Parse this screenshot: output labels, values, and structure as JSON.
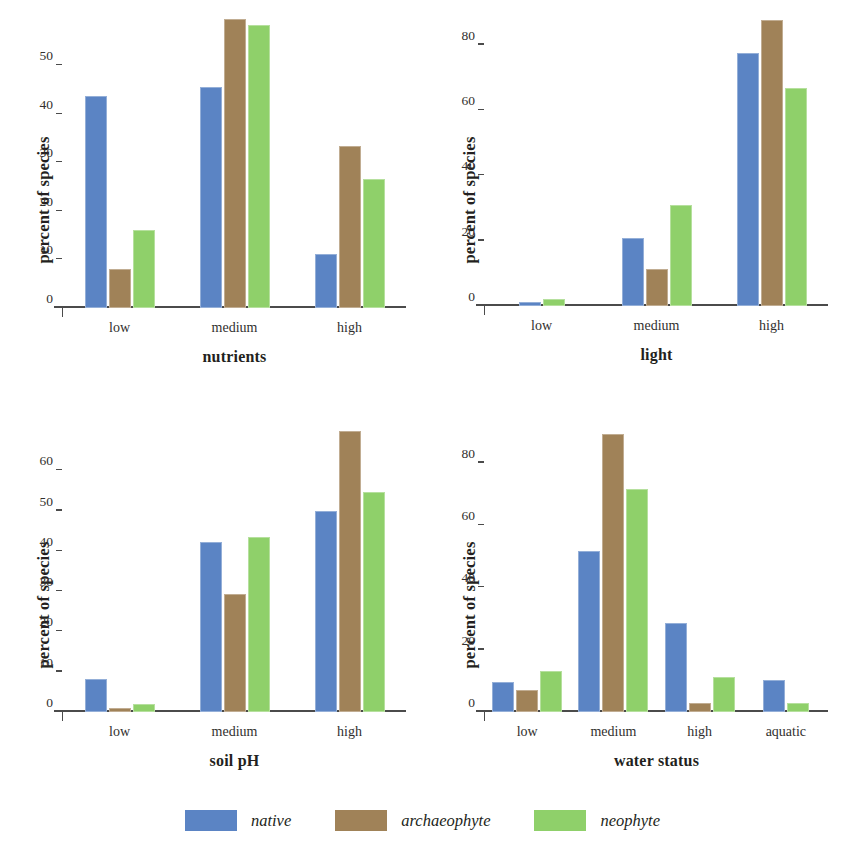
{
  "series_colors": {
    "native": "#5B84C4",
    "archaeophyte": "#A08258",
    "neophyte": "#8FD06A"
  },
  "legend": {
    "position": "bottom-center",
    "items": [
      {
        "label": "native",
        "color": "#5B84C4"
      },
      {
        "label": "archaeophyte",
        "color": "#A08258"
      },
      {
        "label": "neophyte",
        "color": "#8FD06A"
      }
    ]
  },
  "chart_data": [
    {
      "type": "bar",
      "title": "",
      "xlabel": "nutrients",
      "ylabel": "percent of species",
      "categories": [
        "low",
        "medium",
        "high"
      ],
      "yticks": [
        0,
        10,
        20,
        30,
        40,
        50
      ],
      "ylim": [
        0,
        61
      ],
      "grid": false,
      "legend_position": "bottom-center",
      "series": [
        {
          "name": "native",
          "color": "#5B84C4",
          "values": [
            43.7,
            45.6,
            11.1
          ]
        },
        {
          "name": "archaeophyte",
          "color": "#A08258",
          "values": [
            8.0,
            59.6,
            33.4
          ]
        },
        {
          "name": "neophyte",
          "color": "#8FD06A",
          "values": [
            16.1,
            58.4,
            26.6
          ]
        }
      ]
    },
    {
      "type": "bar",
      "title": "",
      "xlabel": "light",
      "ylabel": "percent of species",
      "categories": [
        "low",
        "medium",
        "high"
      ],
      "yticks": [
        0,
        20,
        40,
        60,
        80
      ],
      "ylim": [
        0,
        90
      ],
      "grid": false,
      "legend_position": "bottom-center",
      "series": [
        {
          "name": "native",
          "color": "#5B84C4",
          "values": [
            1.3,
            20.8,
            77.6
          ]
        },
        {
          "name": "archaeophyte",
          "color": "#A08258",
          "values": [
            0,
            11.4,
            87.6
          ]
        },
        {
          "name": "neophyte",
          "color": "#8FD06A",
          "values": [
            2.0,
            31.0,
            66.6
          ]
        }
      ]
    },
    {
      "type": "bar",
      "title": "",
      "xlabel": "soil pH",
      "ylabel": "percent of species",
      "categories": [
        "low",
        "medium",
        "high"
      ],
      "yticks": [
        0,
        10,
        20,
        30,
        40,
        50,
        60
      ],
      "ylim": [
        0,
        72
      ],
      "grid": false,
      "legend_position": "bottom-center",
      "series": [
        {
          "name": "native",
          "color": "#5B84C4",
          "values": [
            8.2,
            42.2,
            50.0
          ]
        },
        {
          "name": "archaeophyte",
          "color": "#A08258",
          "values": [
            1.0,
            29.3,
            69.7
          ]
        },
        {
          "name": "neophyte",
          "color": "#8FD06A",
          "values": [
            2.1,
            43.4,
            54.6
          ]
        }
      ]
    },
    {
      "type": "bar",
      "title": "",
      "xlabel": "water status",
      "ylabel": "percent of species",
      "categories": [
        "low",
        "medium",
        "high",
        "aquatic"
      ],
      "yticks": [
        0,
        20,
        40,
        60,
        80
      ],
      "ylim": [
        0,
        93
      ],
      "grid": false,
      "legend_position": "bottom-center",
      "series": [
        {
          "name": "native",
          "color": "#5B84C4",
          "values": [
            9.5,
            51.6,
            28.6,
            10.2
          ]
        },
        {
          "name": "archaeophyte",
          "color": "#A08258",
          "values": [
            7.0,
            89.0,
            2.9,
            0
          ]
        },
        {
          "name": "neophyte",
          "color": "#8FD06A",
          "values": [
            13.3,
            71.6,
            11.1,
            2.8
          ]
        }
      ]
    }
  ]
}
